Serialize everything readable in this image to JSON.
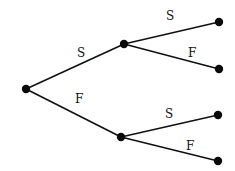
{
  "diagram": {
    "type": "tree",
    "nodes": [
      {
        "id": "root",
        "x": 26,
        "y": 89
      },
      {
        "id": "s",
        "x": 124,
        "y": 44
      },
      {
        "id": "f",
        "x": 121,
        "y": 137
      },
      {
        "id": "ss",
        "x": 219,
        "y": 22
      },
      {
        "id": "sf",
        "x": 219,
        "y": 69
      },
      {
        "id": "fs",
        "x": 218,
        "y": 115
      },
      {
        "id": "ff",
        "x": 218,
        "y": 161
      }
    ],
    "edges": [
      {
        "from": "root",
        "to": "s",
        "label": "S",
        "lx": 77,
        "ly": 57
      },
      {
        "from": "root",
        "to": "f",
        "label": "F",
        "lx": 75,
        "ly": 103
      },
      {
        "from": "s",
        "to": "ss",
        "label": "S",
        "lx": 166,
        "ly": 20
      },
      {
        "from": "s",
        "to": "sf",
        "label": "F",
        "lx": 188,
        "ly": 57
      },
      {
        "from": "f",
        "to": "fs",
        "label": "S",
        "lx": 165,
        "ly": 118
      },
      {
        "from": "f",
        "to": "ff",
        "label": "F",
        "lx": 186,
        "ly": 150
      }
    ]
  }
}
